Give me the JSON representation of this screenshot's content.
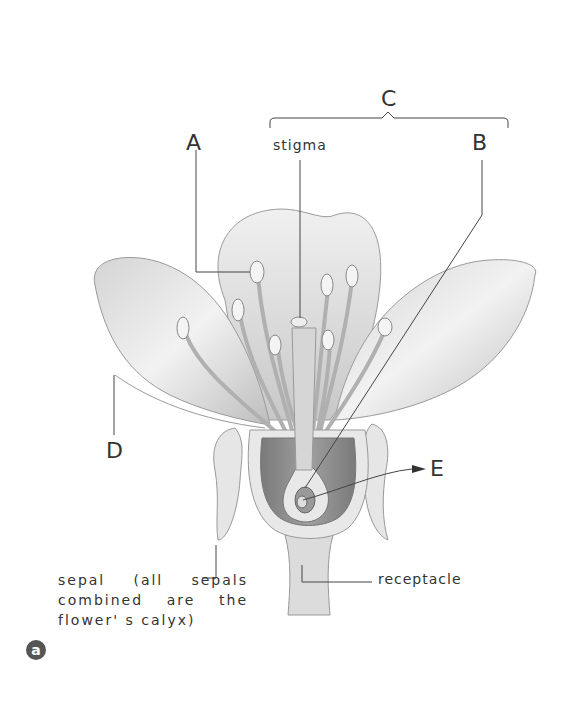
{
  "figure": {
    "panel_badge": "a",
    "labels": {
      "A": "A",
      "B": "B",
      "C": "C",
      "D": "D",
      "E": "E",
      "stigma": "stigma",
      "receptacle": "receptacle",
      "sepal": "sepal (all sepals combined are the flower' s calyx)"
    },
    "colors": {
      "petal_fill": "#e2e2e2",
      "petal_edge": "#9a9a9a",
      "ovary_fill": "#8c8c8c",
      "line": "#444444",
      "badge": "#555555"
    }
  }
}
